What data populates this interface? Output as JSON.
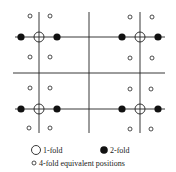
{
  "diagram": {
    "type": "symmetry-positions",
    "colors": {
      "line": "#222222",
      "fill": "#111111",
      "background": "#ffffff"
    },
    "grid": {
      "vertical_lines": [
        {
          "x": 39,
          "y1": 12,
          "y2": 133
        },
        {
          "x": 89,
          "y1": 12,
          "y2": 133
        },
        {
          "x": 140,
          "y1": 12,
          "y2": 133
        }
      ],
      "horizontal_lines": [
        {
          "y": 37,
          "x1": 15,
          "x2": 165
        },
        {
          "y": 73,
          "x1": 13,
          "x2": 165
        },
        {
          "y": 109,
          "x1": 15,
          "x2": 165
        }
      ]
    },
    "one_fold_positions": [
      {
        "x": 39,
        "y": 37
      },
      {
        "x": 140,
        "y": 37
      },
      {
        "x": 39,
        "y": 109
      },
      {
        "x": 140,
        "y": 109
      }
    ],
    "two_fold_positions": [
      {
        "x": 21,
        "y": 37
      },
      {
        "x": 57,
        "y": 37
      },
      {
        "x": 122,
        "y": 37
      },
      {
        "x": 158,
        "y": 37
      },
      {
        "x": 21,
        "y": 109
      },
      {
        "x": 57,
        "y": 109
      },
      {
        "x": 122,
        "y": 109
      },
      {
        "x": 158,
        "y": 109
      }
    ],
    "four_fold_positions": [
      {
        "x": 30,
        "y": 16
      },
      {
        "x": 50,
        "y": 16
      },
      {
        "x": 130,
        "y": 17
      },
      {
        "x": 152,
        "y": 17
      },
      {
        "x": 30,
        "y": 57
      },
      {
        "x": 50,
        "y": 57
      },
      {
        "x": 130,
        "y": 58
      },
      {
        "x": 152,
        "y": 58
      },
      {
        "x": 30,
        "y": 88
      },
      {
        "x": 50,
        "y": 88
      },
      {
        "x": 130,
        "y": 89
      },
      {
        "x": 151,
        "y": 89
      },
      {
        "x": 29,
        "y": 128
      },
      {
        "x": 50,
        "y": 128
      },
      {
        "x": 130,
        "y": 129
      },
      {
        "x": 151,
        "y": 129
      }
    ]
  },
  "legend": {
    "one_fold": "1-fold",
    "two_fold": "2-fold",
    "four_fold": "4-fold equivalent positions"
  }
}
